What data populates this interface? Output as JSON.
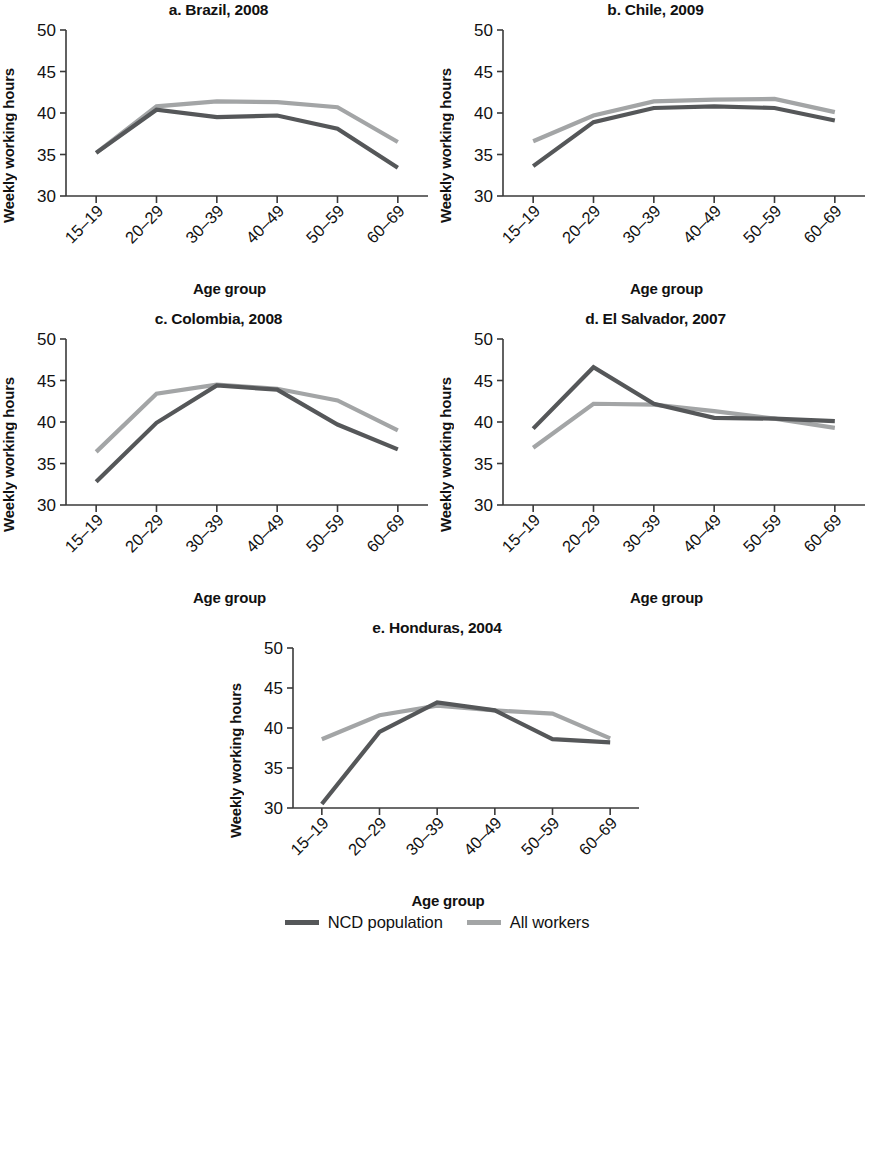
{
  "figure": {
    "ylabel": "Weekly working hours",
    "xlabel": "Age group"
  },
  "legend": {
    "items": [
      {
        "label": "NCD population",
        "color": "#555759"
      },
      {
        "label": "All workers",
        "color": "#a3a5a6"
      }
    ]
  },
  "panels": [
    {
      "key": "a",
      "title": "a. Brazil, 2008"
    },
    {
      "key": "b",
      "title": "b. Chile, 2009"
    },
    {
      "key": "c",
      "title": "c. Colombia, 2008"
    },
    {
      "key": "d",
      "title": "d. El Salvador, 2007"
    },
    {
      "key": "e",
      "title": "e. Honduras, 2004"
    }
  ],
  "chart_data": [
    {
      "type": "line",
      "title": "a. Brazil, 2008",
      "xlabel": "Age group",
      "ylabel": "Weekly working hours",
      "categories": [
        "15–19",
        "20–29",
        "30–39",
        "40–49",
        "50–59",
        "60–69"
      ],
      "ylim": [
        30,
        50
      ],
      "yticks": [
        30,
        35,
        40,
        45,
        50
      ],
      "grid": false,
      "legend_position": "figure-bottom",
      "series": [
        {
          "name": "NCD population",
          "color": "#555759",
          "values": [
            35.2,
            40.4,
            39.5,
            39.7,
            38.1,
            33.4
          ]
        },
        {
          "name": "All workers",
          "color": "#a3a5a6",
          "values": [
            35.2,
            40.8,
            41.4,
            41.3,
            40.7,
            36.5
          ]
        }
      ]
    },
    {
      "type": "line",
      "title": "b. Chile, 2009",
      "xlabel": "Age group",
      "ylabel": "Weekly working hours",
      "categories": [
        "15–19",
        "20–29",
        "30–39",
        "40–49",
        "50–59",
        "60–69"
      ],
      "ylim": [
        30,
        50
      ],
      "yticks": [
        30,
        35,
        40,
        45,
        50
      ],
      "grid": false,
      "legend_position": "figure-bottom",
      "series": [
        {
          "name": "NCD population",
          "color": "#555759",
          "values": [
            33.6,
            38.9,
            40.6,
            40.8,
            40.6,
            39.1
          ]
        },
        {
          "name": "All workers",
          "color": "#a3a5a6",
          "values": [
            36.6,
            39.7,
            41.4,
            41.6,
            41.7,
            40.1
          ]
        }
      ]
    },
    {
      "type": "line",
      "title": "c. Colombia, 2008",
      "xlabel": "Age group",
      "ylabel": "Weekly working hours",
      "categories": [
        "15–19",
        "20–29",
        "30–39",
        "40–49",
        "50–59",
        "60–69"
      ],
      "ylim": [
        30,
        50
      ],
      "yticks": [
        30,
        35,
        40,
        45,
        50
      ],
      "grid": false,
      "legend_position": "figure-bottom",
      "series": [
        {
          "name": "NCD population",
          "color": "#555759",
          "values": [
            32.8,
            39.9,
            44.4,
            43.9,
            39.7,
            36.7
          ]
        },
        {
          "name": "All workers",
          "color": "#a3a5a6",
          "values": [
            36.4,
            43.4,
            44.5,
            44.0,
            42.6,
            39.0
          ]
        }
      ]
    },
    {
      "type": "line",
      "title": "d. El Salvador, 2007",
      "xlabel": "Age group",
      "ylabel": "Weekly working hours",
      "categories": [
        "15–19",
        "20–29",
        "30–39",
        "40–49",
        "50–59",
        "60–69"
      ],
      "ylim": [
        30,
        50
      ],
      "yticks": [
        30,
        35,
        40,
        45,
        50
      ],
      "grid": false,
      "legend_position": "figure-bottom",
      "series": [
        {
          "name": "NCD population",
          "color": "#555759",
          "values": [
            39.2,
            46.6,
            42.2,
            40.5,
            40.4,
            40.1
          ]
        },
        {
          "name": "All workers",
          "color": "#a3a5a6",
          "values": [
            36.9,
            42.2,
            42.1,
            41.3,
            40.4,
            39.3
          ]
        }
      ]
    },
    {
      "type": "line",
      "title": "e. Honduras, 2004",
      "xlabel": "Age group",
      "ylabel": "Weekly working hours",
      "categories": [
        "15–19",
        "20–29",
        "30–39",
        "40–49",
        "50–59",
        "60–69"
      ],
      "ylim": [
        30,
        50
      ],
      "yticks": [
        30,
        35,
        40,
        45,
        50
      ],
      "grid": false,
      "legend_position": "figure-bottom",
      "series": [
        {
          "name": "NCD population",
          "color": "#555759",
          "values": [
            30.5,
            39.5,
            43.2,
            42.2,
            38.6,
            38.2
          ]
        },
        {
          "name": "All workers",
          "color": "#a3a5a6",
          "values": [
            38.6,
            41.6,
            42.8,
            42.2,
            41.8,
            38.7
          ]
        }
      ]
    }
  ]
}
